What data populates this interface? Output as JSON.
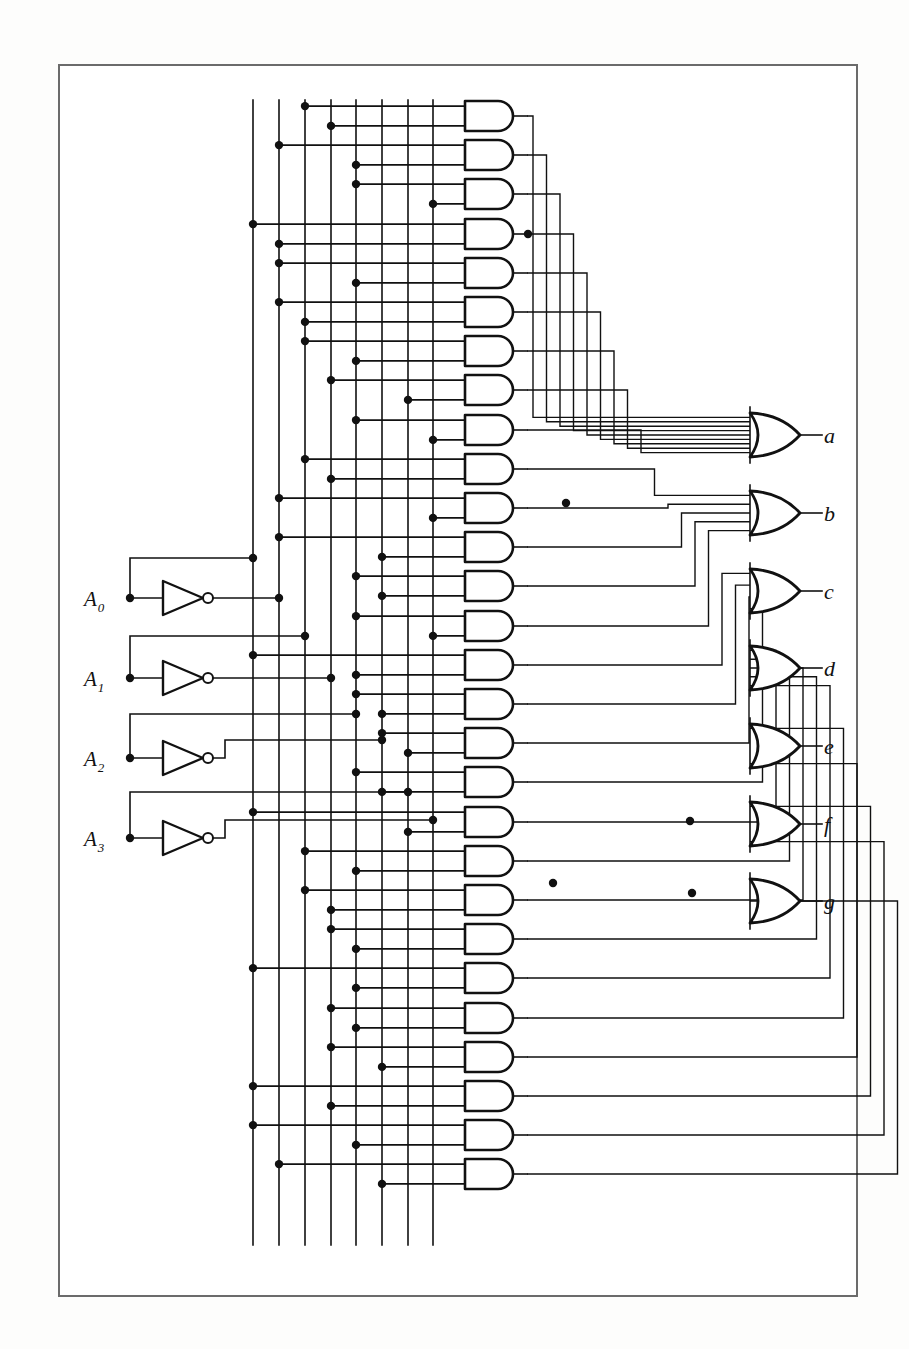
{
  "figure": {
    "kind": "logic-circuit-diagram",
    "frame": {
      "x": 58,
      "y": 64,
      "width": 800,
      "height": 1233,
      "border_color": "#6b6b6b"
    },
    "ink_color": "#111111",
    "background_color": "#ffffff"
  },
  "inputs": {
    "count": 4,
    "items": [
      {
        "label": "A",
        "subscript": "0",
        "y": 598,
        "terminal_x": 130,
        "inverter_x": 163
      },
      {
        "label": "A",
        "subscript": "1",
        "y": 678,
        "terminal_x": 130,
        "inverter_x": 163
      },
      {
        "label": "A",
        "subscript": "2",
        "y": 758,
        "terminal_x": 130,
        "inverter_x": 163
      },
      {
        "label": "A",
        "subscript": "3",
        "y": 838,
        "terminal_x": 130,
        "inverter_x": 163
      }
    ]
  },
  "inverters": {
    "count": 4,
    "shape": "triangle-with-bubble",
    "width": 40,
    "height": 34,
    "bubble_radius": 5
  },
  "buses": {
    "count": 8,
    "note": "vertical lines carrying true and complemented input literals",
    "x_positions": [
      253,
      279,
      305,
      331,
      356,
      382,
      408,
      433
    ],
    "top": 100,
    "bottom": 1245
  },
  "and_gates": {
    "count": 28,
    "label": "product terms",
    "shape": "D-shape",
    "x": 465,
    "width": 48,
    "height": 30,
    "first_y": 116,
    "pitch": 39.2
  },
  "or_gates": {
    "count": 7,
    "shape": "curved-back-or",
    "x": 750,
    "width": 50,
    "height": 44,
    "items": [
      {
        "label": "a",
        "y": 435
      },
      {
        "label": "b",
        "y": 513
      },
      {
        "label": "c",
        "y": 591
      },
      {
        "label": "d",
        "y": 668
      },
      {
        "label": "e",
        "y": 746
      },
      {
        "label": "f",
        "y": 824
      },
      {
        "label": "g",
        "y": 901
      }
    ],
    "output_label_x": 824
  },
  "outputs": {
    "labels": [
      "a",
      "b",
      "c",
      "d",
      "e",
      "f",
      "g"
    ]
  },
  "junction_dots": {
    "radius": 4.2,
    "color": "#111111"
  }
}
